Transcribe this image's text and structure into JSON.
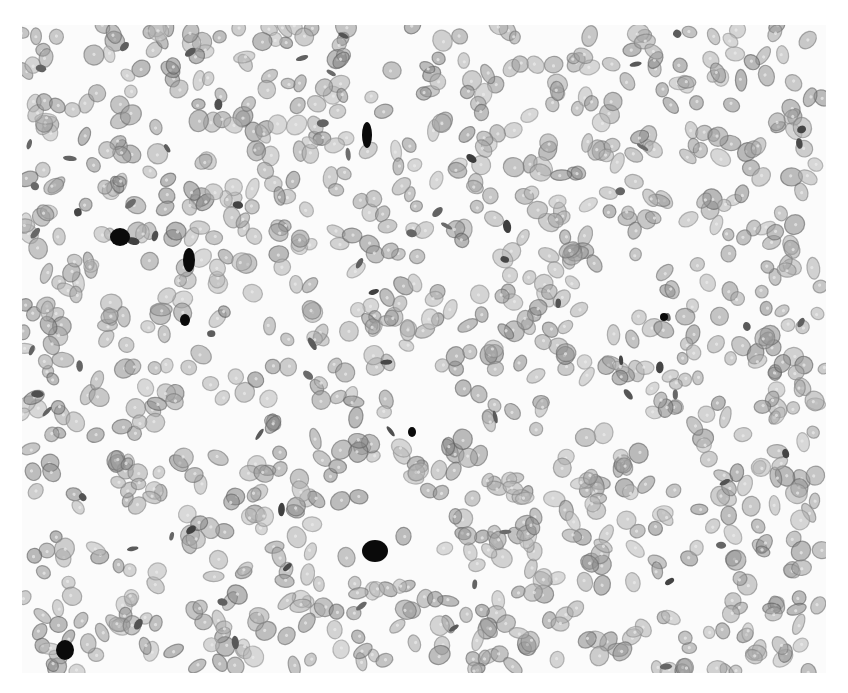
{
  "image": {
    "description": "Grayscale microscopy image of a tissue section with densely packed light-gray nuclei and a few darkly stained nuclei",
    "background": "#fbfbfb",
    "nucleus_color": "#8c8c8c",
    "dark_nucleus_color": "#0a0a0a",
    "dark_nuclei": [
      {
        "x": 345,
        "y": 110,
        "rx": 5,
        "ry": 13
      },
      {
        "x": 98,
        "y": 212,
        "rx": 10,
        "ry": 9
      },
      {
        "x": 167,
        "y": 235,
        "rx": 6,
        "ry": 12
      },
      {
        "x": 163,
        "y": 295,
        "rx": 5,
        "ry": 6
      },
      {
        "x": 390,
        "y": 407,
        "rx": 4,
        "ry": 5
      },
      {
        "x": 353,
        "y": 526,
        "rx": 13,
        "ry": 11
      },
      {
        "x": 43,
        "y": 625,
        "rx": 9,
        "ry": 10
      },
      {
        "x": 642,
        "y": 292,
        "rx": 4,
        "ry": 4
      }
    ]
  }
}
